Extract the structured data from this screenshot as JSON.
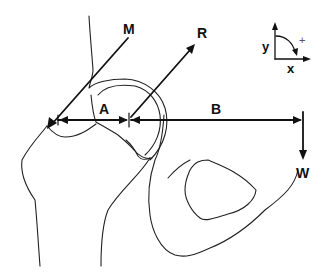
{
  "diagram": {
    "type": "biomechanics-free-body-diagram",
    "labels": {
      "muscle_force": "M",
      "joint_reaction_force": "R",
      "weight_force": "W",
      "moment_arm_abductor": "A",
      "moment_arm_weight": "B"
    },
    "axes": {
      "y_label": "y",
      "x_label": "x",
      "rotation_sign": "+"
    },
    "colors": {
      "line": "#111111",
      "background": "#ffffff"
    }
  }
}
